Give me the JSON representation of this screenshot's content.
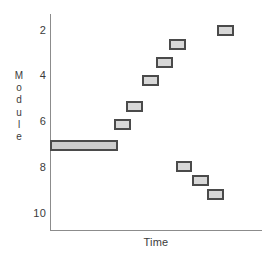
{
  "chart_data": {
    "type": "bar",
    "title": "",
    "xlabel": "Time",
    "ylabel": "Module",
    "y_tick_labels": [
      "2",
      "4",
      "6",
      "8",
      "10"
    ],
    "y_tick_values": [
      2,
      4,
      6,
      8,
      10
    ],
    "ylim": [
      0.5,
      10.8
    ],
    "y_inverted": true,
    "x_tick_labels": [],
    "xlim": [
      0,
      10
    ],
    "grid": false,
    "legend": null,
    "series": [
      {
        "name": "Module activity",
        "note": "Rectangular block markers; one wide block at module 7 anchored at the time origin",
        "points": [
          {
            "module": 7.0,
            "x_start": 0.0,
            "x_end": 3.21,
            "width": "wide"
          },
          {
            "module": 6.1,
            "x_start": 3.02,
            "x_end": 3.82,
            "width": "narrow"
          },
          {
            "module": 5.3,
            "x_start": 3.6,
            "x_end": 4.4,
            "width": "narrow"
          },
          {
            "module": 4.2,
            "x_start": 4.36,
            "x_end": 5.16,
            "width": "narrow"
          },
          {
            "module": 3.4,
            "x_start": 5.0,
            "x_end": 5.8,
            "width": "narrow"
          },
          {
            "module": 2.6,
            "x_start": 5.59,
            "x_end": 6.4,
            "width": "narrow"
          },
          {
            "module": 2.0,
            "x_start": 7.86,
            "x_end": 8.66,
            "width": "narrow"
          },
          {
            "module": 7.95,
            "x_start": 5.92,
            "x_end": 6.72,
            "width": "narrow"
          },
          {
            "module": 8.55,
            "x_start": 6.7,
            "x_end": 7.5,
            "width": "narrow"
          },
          {
            "module": 9.15,
            "x_start": 7.42,
            "x_end": 8.22,
            "width": "narrow"
          }
        ]
      }
    ],
    "colors": {
      "marker_fill": "#d7d7d7",
      "marker_border": "#4a4a4a",
      "axis": "#8c8c8c",
      "text": "#3b3b3b",
      "background": "#ffffff"
    }
  }
}
